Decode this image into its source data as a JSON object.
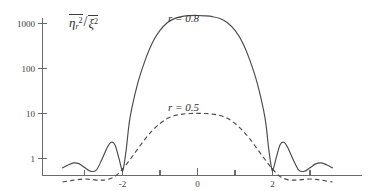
{
  "figure": {
    "background_color": "#ffffff",
    "axis_color": "#6b6b6b",
    "curve_color": "#4a4a4a",
    "y_axis_title_parts": {
      "numerator_symbol": "η",
      "numerator_subscript": "r",
      "numerator_exponent": "2",
      "denominator_symbol": "ξ",
      "denominator_exponent": "2",
      "separator": "/"
    }
  },
  "chart_data": {
    "type": "line",
    "title": "",
    "xlabel": "",
    "ylabel": "η̄_r² / ξ̄²",
    "yscale": "log",
    "ylim": [
      0.2,
      3000
    ],
    "xlim": [
      -3.6,
      3.6
    ],
    "grid": false,
    "legend": "inline-annotations",
    "y_ticks": [
      {
        "value": 1000,
        "label": "1000"
      },
      {
        "value": 100,
        "label": "100"
      },
      {
        "value": 10,
        "label": "10"
      },
      {
        "value": 1,
        "label": "1"
      }
    ],
    "x_ticks_major": [
      {
        "value": -2,
        "label": "-2"
      },
      {
        "value": 0,
        "label": "0"
      },
      {
        "value": 2,
        "label": "2"
      }
    ],
    "x_ticks_minor": [
      -3,
      -1,
      1,
      3
    ],
    "annotations": [
      {
        "text": "r = 0.8",
        "x": 0.0,
        "y_pixel_top": 12,
        "series": "r=0.8"
      },
      {
        "text": "r = 0.5",
        "x": 0.0,
        "y_pixel_top": 101,
        "series": "r=0.5"
      }
    ],
    "series": [
      {
        "name": "r = 0.8",
        "style": "solid",
        "peak_value": 1500,
        "null_positions": [
          -2,
          2
        ],
        "x": [
          -3.6,
          -3.45,
          -3.3,
          -3.15,
          -3.0,
          -2.85,
          -2.7,
          -2.55,
          -2.4,
          -2.3,
          -2.2,
          -2.1,
          -2.02,
          -1.98,
          -1.9,
          -1.8,
          -1.6,
          -1.4,
          -1.2,
          -1.0,
          -0.8,
          -0.6,
          -0.4,
          -0.2,
          0.0,
          0.2,
          0.4,
          0.6,
          0.8,
          1.0,
          1.2,
          1.4,
          1.6,
          1.8,
          1.9,
          1.98,
          2.02,
          2.1,
          2.2,
          2.3,
          2.4,
          2.55,
          2.7,
          2.85,
          3.0,
          3.15,
          3.3,
          3.45,
          3.6
        ],
        "y": [
          0.62,
          0.72,
          0.8,
          0.76,
          0.62,
          0.52,
          0.55,
          0.95,
          1.8,
          2.3,
          2.0,
          1.05,
          0.58,
          0.58,
          1.6,
          8,
          45,
          150,
          380,
          700,
          1050,
          1300,
          1440,
          1500,
          1510,
          1480,
          1420,
          1290,
          1040,
          700,
          380,
          150,
          45,
          8,
          1.6,
          0.58,
          0.58,
          1.05,
          2.0,
          2.3,
          1.8,
          0.95,
          0.55,
          0.52,
          0.62,
          0.76,
          0.8,
          0.72,
          0.62
        ]
      },
      {
        "name": "r = 0.5",
        "style": "dashed",
        "peak_value": 10,
        "x": [
          -3.6,
          -3.4,
          -3.2,
          -3.0,
          -2.8,
          -2.6,
          -2.4,
          -2.2,
          -2.0,
          -1.8,
          -1.6,
          -1.4,
          -1.2,
          -1.0,
          -0.8,
          -0.6,
          -0.4,
          -0.2,
          0.0,
          0.2,
          0.4,
          0.6,
          0.8,
          1.0,
          1.2,
          1.4,
          1.6,
          1.8,
          2.0,
          2.2,
          2.4,
          2.6,
          2.8,
          3.0,
          3.2,
          3.4,
          3.6
        ],
        "y": [
          0.3,
          0.32,
          0.34,
          0.35,
          0.34,
          0.33,
          0.34,
          0.4,
          0.58,
          0.95,
          1.6,
          2.7,
          4.2,
          6.0,
          7.8,
          9.0,
          9.7,
          10.0,
          10.1,
          10.0,
          9.7,
          9.0,
          7.8,
          6.0,
          4.2,
          2.7,
          1.6,
          0.95,
          0.58,
          0.4,
          0.34,
          0.33,
          0.34,
          0.35,
          0.34,
          0.32,
          0.3
        ]
      }
    ]
  }
}
